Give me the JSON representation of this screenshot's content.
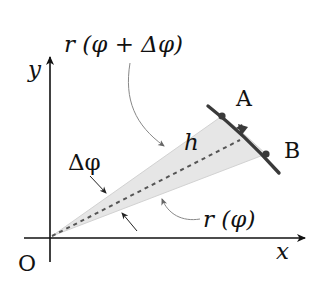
{
  "diagram": {
    "colors": {
      "background": "#ffffff",
      "ink": "#111111",
      "sector_fill": "#e6e6e6",
      "curve": "#3a3a3a",
      "dashed": "#555555",
      "leader": "#777777"
    },
    "labels": {
      "y_axis": "y",
      "x_axis": "x",
      "origin": "O",
      "point_a": "A",
      "point_b": "B",
      "height": "h",
      "delta_phi": "Δφ",
      "r_phi_plus": "r (φ + Δφ)",
      "r_phi": "r (φ)"
    },
    "points": {
      "origin": [
        50,
        237
      ],
      "A": [
        222,
        116
      ],
      "B": [
        266,
        154
      ]
    }
  }
}
